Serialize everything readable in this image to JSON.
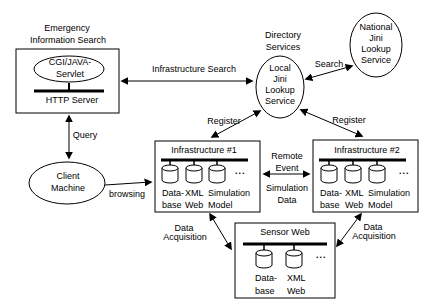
{
  "nodes": {
    "emergency": {
      "label1": "Emergency",
      "label2": "Information Search",
      "servlet1": "CGI/JAVA-",
      "servlet2": "Servlet",
      "server": "HTTP Server"
    },
    "directory": {
      "label1": "Directory",
      "label2": "Services",
      "l1": "Local",
      "l2": "Jini",
      "l3": "Lookup",
      "l4": "Service"
    },
    "national": {
      "l1": "National",
      "l2": "Jini",
      "l3": "Lookup",
      "l4": "Service"
    },
    "client": {
      "l1": "Client",
      "l2": "Machine"
    },
    "infra1": {
      "title": "Infrastructure #1",
      "c1a": "Data-",
      "c1b": "base",
      "c2a": "XML",
      "c2b": "Web",
      "c3a": "Simulation",
      "c3b": "Model",
      "more": "..."
    },
    "infra2": {
      "title": "Infrastructure #2",
      "c1a": "Data-",
      "c1b": "base",
      "c2a": "XML",
      "c2b": "Web",
      "c3a": "Simulation",
      "c3b": "Model",
      "more": "..."
    },
    "sensor": {
      "title": "Sensor Web",
      "c1a": "Data-",
      "c1b": "base",
      "c2a": "XML",
      "c2b": "Web",
      "more": "..."
    }
  },
  "edges": {
    "infrastructure_search": "Infrastructure Search",
    "search": "Search",
    "query": "Query",
    "browsing": "browsing",
    "register_left": "Register",
    "register_right": "Register",
    "remote_a": "Remote",
    "remote_b": "Event",
    "sim_a": "Simulation",
    "sim_b": "Data",
    "acq_left_a": "Data",
    "acq_left_b": "Acquisition",
    "acq_right_a": "Data",
    "acq_right_b": "Acquisition"
  },
  "colors": {
    "ink": "#000000",
    "paper": "#ffffff"
  }
}
